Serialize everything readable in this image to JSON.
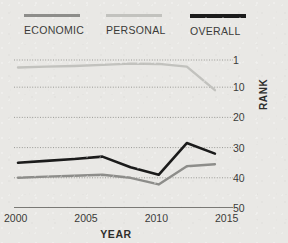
{
  "legend": {
    "items": [
      {
        "label": "ECONOMIC",
        "color": "#8d8d8a",
        "weight": "normal"
      },
      {
        "label": "PERSONAL",
        "color": "#c2c2be",
        "weight": "normal"
      },
      {
        "label": "OVERALL",
        "color": "#1b1b1b",
        "weight": "thick"
      }
    ]
  },
  "axes": {
    "y_title": "RANK",
    "x_title": "YEAR",
    "y_ticks": [
      "1",
      "10",
      "20",
      "30",
      "40",
      "50"
    ],
    "x_ticks": [
      "2000",
      "2005",
      "2010",
      "2015"
    ]
  },
  "colors": {
    "background": "#e9e8e5",
    "text": "#3a3a38",
    "gridline": "#9a9a96",
    "axis": "#55554f",
    "economic": "#8d8d8a",
    "personal": "#c2c2be",
    "overall": "#1b1b1b"
  },
  "chart_data": {
    "type": "line",
    "title": "",
    "xlabel": "YEAR",
    "ylabel": "RANK",
    "xlim": [
      2000,
      2015
    ],
    "ylim": [
      1,
      50
    ],
    "y_inverted": true,
    "y_ticks": [
      1,
      10,
      20,
      30,
      40,
      50
    ],
    "x_ticks": [
      2000,
      2005,
      2010,
      2015
    ],
    "grid": "dotted-horizontal",
    "legend_position": "top",
    "x": [
      2000,
      2002,
      2004,
      2006,
      2008,
      2010,
      2012,
      2014
    ],
    "series": [
      {
        "name": "PERSONAL",
        "color": "#c2c2be",
        "values": [
          3.5,
          3.2,
          3.0,
          2.6,
          2.2,
          2.3,
          3.2,
          11.0
        ]
      },
      {
        "name": "OVERALL",
        "color": "#1b1b1b",
        "values": [
          35.0,
          34.4,
          33.8,
          33.0,
          36.5,
          39.0,
          28.5,
          32.0
        ]
      },
      {
        "name": "ECONOMIC",
        "color": "#8d8d8a",
        "values": [
          40.0,
          39.6,
          39.3,
          39.0,
          40.0,
          42.2,
          36.2,
          35.5
        ]
      }
    ]
  }
}
